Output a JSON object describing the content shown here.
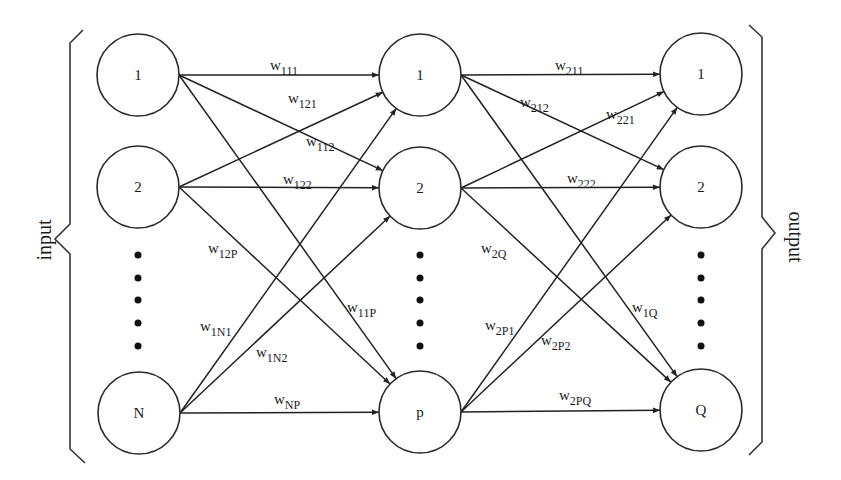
{
  "diagram": {
    "type": "feedforward-neural-network",
    "side_labels": {
      "input": "input",
      "output": "output"
    },
    "layers": [
      {
        "id": "input",
        "nodes": [
          {
            "id": "in1",
            "label": "1",
            "cx": 138,
            "cy": 75
          },
          {
            "id": "in2",
            "label": "2",
            "cx": 138,
            "cy": 187
          },
          {
            "id": "inN",
            "label": "N",
            "cx": 139,
            "cy": 413
          }
        ],
        "dots_cx": 138
      },
      {
        "id": "hidden",
        "nodes": [
          {
            "id": "h1",
            "label": "1",
            "cx": 420,
            "cy": 75
          },
          {
            "id": "h2",
            "label": "2",
            "cx": 420,
            "cy": 188
          },
          {
            "id": "hp",
            "label": "p",
            "cx": 420,
            "cy": 412
          }
        ],
        "dots_cx": 420
      },
      {
        "id": "output",
        "nodes": [
          {
            "id": "o1",
            "label": "1",
            "cx": 701,
            "cy": 74
          },
          {
            "id": "o2",
            "label": "2",
            "cx": 701,
            "cy": 187
          },
          {
            "id": "oQ",
            "label": "Q",
            "cx": 701,
            "cy": 410
          }
        ],
        "dots_cx": 701
      }
    ],
    "node_radius": 41,
    "dots_y": [
      255,
      278,
      300,
      323,
      346
    ],
    "edges": [
      {
        "from": "in1",
        "to": "h1",
        "weight": {
          "base": "w",
          "sub": "111"
        },
        "lx": 270,
        "ly": 70
      },
      {
        "from": "in2",
        "to": "h1",
        "weight": {
          "base": "w",
          "sub": "121"
        },
        "lx": 288,
        "ly": 103
      },
      {
        "from": "in1",
        "to": "h2",
        "weight": {
          "base": "w",
          "sub": "112"
        },
        "lx": 306,
        "ly": 146
      },
      {
        "from": "in2",
        "to": "h2",
        "weight": {
          "base": "w",
          "sub": "122"
        },
        "lx": 283,
        "ly": 184
      },
      {
        "from": "in2",
        "to": "hp",
        "weight": {
          "base": "w",
          "sub": "12P"
        },
        "lx": 208,
        "ly": 253
      },
      {
        "from": "in1",
        "to": "hp",
        "weight": {
          "base": "w",
          "sub": "11P"
        },
        "lx": 347,
        "ly": 312
      },
      {
        "from": "inN",
        "to": "h1",
        "weight": {
          "base": "w",
          "sub": "1N1"
        },
        "lx": 200,
        "ly": 331
      },
      {
        "from": "inN",
        "to": "h2",
        "weight": {
          "base": "w",
          "sub": "1N2"
        },
        "lx": 256,
        "ly": 357
      },
      {
        "from": "inN",
        "to": "hp",
        "weight": {
          "base": "w",
          "sub": "NP"
        },
        "lx": 274,
        "ly": 404
      },
      {
        "from": "h1",
        "to": "o1",
        "weight": {
          "base": "w",
          "sub": "211"
        },
        "lx": 555,
        "ly": 70
      },
      {
        "from": "h1",
        "to": "o2",
        "weight": {
          "base": "w",
          "sub": "212"
        },
        "lx": 520,
        "ly": 107
      },
      {
        "from": "h2",
        "to": "o1",
        "weight": {
          "base": "w",
          "sub": "221"
        },
        "lx": 606,
        "ly": 119
      },
      {
        "from": "h2",
        "to": "o2",
        "weight": {
          "base": "w",
          "sub": "222"
        },
        "lx": 567,
        "ly": 183
      },
      {
        "from": "h2",
        "to": "oQ",
        "weight": {
          "base": "w",
          "sub": "2Q"
        },
        "lx": 481,
        "ly": 253
      },
      {
        "from": "h1",
        "to": "oQ",
        "weight": {
          "base": "w",
          "sub": "1Q"
        },
        "lx": 632,
        "ly": 312
      },
      {
        "from": "hp",
        "to": "o1",
        "weight": {
          "base": "w",
          "sub": "2P1"
        },
        "lx": 485,
        "ly": 330
      },
      {
        "from": "hp",
        "to": "o2",
        "weight": {
          "base": "w",
          "sub": "2P2"
        },
        "lx": 541,
        "ly": 345
      },
      {
        "from": "hp",
        "to": "oQ",
        "weight": {
          "base": "w",
          "sub": "2PQ"
        },
        "lx": 559,
        "ly": 400
      }
    ],
    "colors": {
      "stroke": "#222222",
      "background": "#ffffff"
    }
  }
}
